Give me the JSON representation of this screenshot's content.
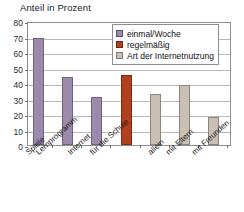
{
  "chart_data": {
    "type": "bar",
    "title": "Anteil in Prozent",
    "xlabel": "",
    "ylabel": "",
    "ylim": [
      0,
      80
    ],
    "yticks": [
      0,
      10,
      20,
      30,
      40,
      50,
      60,
      70,
      80
    ],
    "grid": true,
    "legend_position": "top-right",
    "categories": [
      "Spiele",
      "Lernprogramm",
      "Internet",
      "für die Schule",
      "allein",
      "mit Eltern",
      "mit Freunden"
    ],
    "values": [
      69,
      44,
      31,
      45,
      33,
      39,
      18
    ],
    "bar_groups": [
      "einmal/Woche",
      "einmal/Woche",
      "einmal/Woche",
      "regelmäßig",
      "Art der Internetnutzung",
      "Art der Internetnutzung",
      "Art der Internetnutzung"
    ],
    "legend": [
      {
        "label": "einmal/Woche",
        "color": "#9b8aab"
      },
      {
        "label": "regelmäßig",
        "color": "#b1401f"
      },
      {
        "label": "Art der Internetnutzung",
        "color": "#c9bfb4"
      }
    ],
    "colors": {
      "purple": "#9b8aab",
      "red": "#b1401f",
      "tan": "#c9bfb4",
      "frame": "#8e8e8e",
      "grid": "#b9b9b9"
    }
  }
}
